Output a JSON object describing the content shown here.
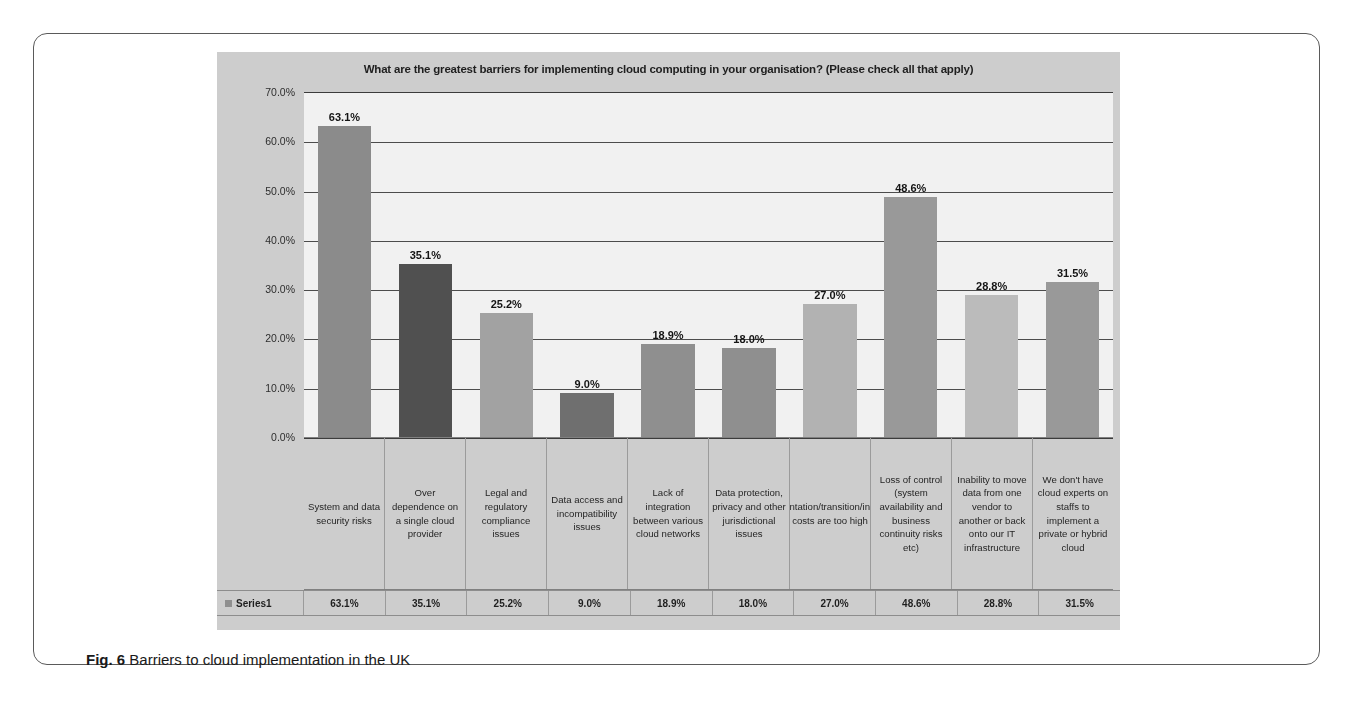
{
  "figure": {
    "caption_label": "Fig. 6",
    "caption_text": "Barriers to cloud implementation in the UK"
  },
  "chart_data": {
    "type": "bar",
    "title": "What are the greatest barriers for implementing cloud computing in your organisation? (Please check all that apply)",
    "xlabel": "",
    "ylabel": "",
    "ylim": [
      0,
      70
    ],
    "grid": true,
    "legend_position": "bottom-table",
    "series_name": "Series1",
    "ytick_labels": [
      "70.0%",
      "60.0%",
      "50.0%",
      "40.0%",
      "30.0%",
      "20.0%",
      "10.0%",
      "0.0%"
    ],
    "ytick_values": [
      70,
      60,
      50,
      40,
      30,
      20,
      10,
      0
    ],
    "categories": [
      "System and data security risks",
      "Over dependence on a single cloud provider",
      "Legal and regulatory compliance issues",
      "Data access and incompatibility issues",
      "Lack of integration between various cloud networks",
      "Data protection, privacy and other jurisdictional issues",
      "Implementation/transition/integration costs are too high",
      "Loss of control (system availability and business continuity risks etc)",
      "Inability to move data from one vendor to another or back onto our IT infrastructure",
      "We don't have cloud experts on staffs to implement a private or hybrid cloud"
    ],
    "values": [
      63.1,
      35.1,
      25.2,
      9.0,
      18.9,
      18.0,
      27.0,
      48.6,
      28.8,
      31.5
    ],
    "value_labels": [
      "63.1%",
      "35.1%",
      "25.2%",
      "9.0%",
      "18.9%",
      "18.0%",
      "27.0%",
      "48.6%",
      "28.8%",
      "31.5%"
    ],
    "bar_colors": [
      "#8b8b8b",
      "#4f4f4f",
      "#a3a3a3",
      "#6e6e6e",
      "#8f8f8f",
      "#8f8f8f",
      "#b4b4b4",
      "#9a9a9a",
      "#bdbdbd",
      "#9a9a9a"
    ],
    "plot_background": "#f4f4f4",
    "chart_background": "#cfcfcf"
  }
}
